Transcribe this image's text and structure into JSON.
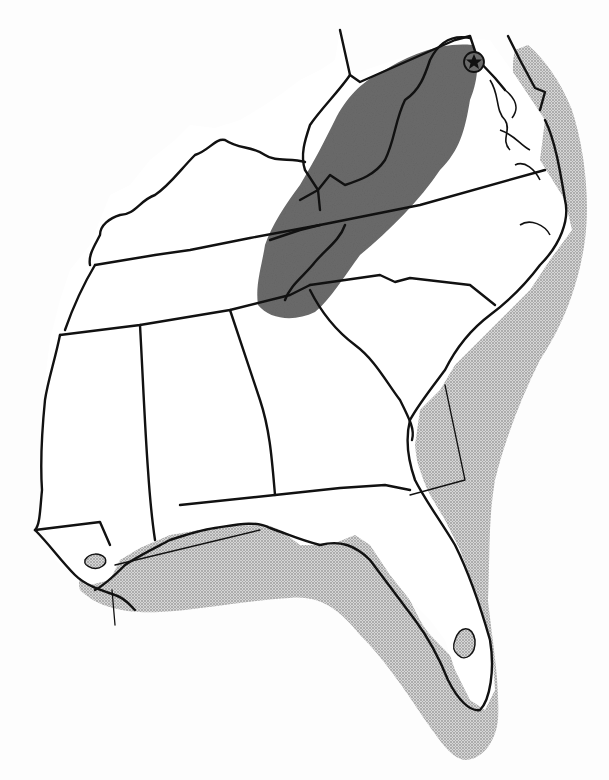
{
  "map": {
    "region": "Southeastern United States",
    "style": "black-and-white line map with shaded range overlays",
    "background_color": "#fdfdfd",
    "land_color": "#ffffff",
    "border_color": "#111111",
    "layers": [
      {
        "id": "inland-range",
        "description": "Dark gray shaded band along the Appalachian region (western Virginia, eastern West Virginia, western North Carolina)",
        "color": "#6b6b6b"
      },
      {
        "id": "coastal-range",
        "description": "Light dotted stipple along the Atlantic coast from Maryland/Delaware to Florida and the Gulf coast to Louisiana",
        "color": "#b9b9b9"
      },
      {
        "id": "marker",
        "description": "Star within circle near Washington, D.C. / Potomac River",
        "icon": "star-in-circle-icon"
      }
    ],
    "states_shown": [
      "West Virginia",
      "Virginia",
      "Maryland",
      "Delaware",
      "Kentucky",
      "Tennessee",
      "North Carolina",
      "South Carolina",
      "Georgia",
      "Alabama",
      "Mississippi",
      "Louisiana",
      "Florida"
    ],
    "labels": []
  }
}
